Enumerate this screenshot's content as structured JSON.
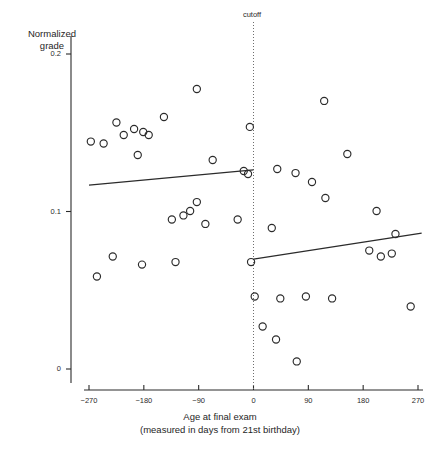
{
  "chart_data": {
    "type": "scatter",
    "title": "",
    "xlabel": "Age at final exam",
    "xlabel_line2": "(measured in days from 21st birthday)",
    "ylabel": "Normalized grade",
    "ylabel_line1": "Normalized",
    "ylabel_line2": "grade",
    "xlim": [
      -300,
      285
    ],
    "ylim": [
      -0.012,
      0.207
    ],
    "xticks": [
      -270,
      -180,
      -90,
      0,
      90,
      180,
      270
    ],
    "xticklabels": [
      "−270",
      "−180",
      "−90",
      "0",
      "90",
      "180",
      "270"
    ],
    "yticks": [
      0,
      0.1,
      0.2
    ],
    "yticklabels": [
      "0",
      "0.1",
      "0.2"
    ],
    "grid": false,
    "legend": false,
    "marker": "open-circle",
    "marker_color": "#2b2b2b",
    "line_color": "#2b2b2b",
    "annotations": [
      {
        "name": "cutoff",
        "label": "cutoff",
        "x": 0,
        "style": "dotted-vertical-line"
      }
    ],
    "series": [
      {
        "name": "left-of-cutoff points",
        "points": [
          [
            -267,
            0.1444
          ],
          [
            -246,
            0.1432
          ],
          [
            -225,
            0.1565
          ],
          [
            -213,
            0.1486
          ],
          [
            -196,
            0.1524
          ],
          [
            -190,
            0.1359
          ],
          [
            -181,
            0.1505
          ],
          [
            -172,
            0.1486
          ],
          [
            -147,
            0.16
          ],
          [
            -93,
            0.1778
          ],
          [
            -67,
            0.1327
          ],
          [
            -16,
            0.1257
          ],
          [
            -9,
            0.1238
          ],
          [
            -134,
            0.0949
          ],
          [
            -115,
            0.0975
          ],
          [
            -104,
            0.1003
          ],
          [
            -93,
            0.106
          ],
          [
            -79,
            0.0921
          ],
          [
            -257,
            0.0587
          ],
          [
            -231,
            0.0714
          ],
          [
            -183,
            0.0663
          ],
          [
            -128,
            0.0679
          ],
          [
            -6,
            0.1537
          ]
        ]
      },
      {
        "name": "right-of-cutoff points",
        "points": [
          [
            39,
            0.127
          ],
          [
            69,
            0.1244
          ],
          [
            116,
            0.1702
          ],
          [
            96,
            0.1187
          ],
          [
            154,
            0.1365
          ],
          [
            118,
            0.1086
          ],
          [
            202,
            0.1003
          ],
          [
            233,
            0.0857
          ],
          [
            190,
            0.0752
          ],
          [
            209,
            0.0714
          ],
          [
            227,
            0.0733
          ],
          [
            30,
            0.0895
          ],
          [
            2,
            0.046
          ],
          [
            44,
            0.0448
          ],
          [
            86,
            0.046
          ],
          [
            129,
            0.0448
          ],
          [
            258,
            0.0397
          ],
          [
            15,
            0.027
          ],
          [
            37,
            0.0187
          ],
          [
            71,
            0.0048
          ],
          [
            -26,
            0.0949
          ],
          [
            -4,
            0.0679
          ]
        ]
      }
    ],
    "fit_lines": [
      {
        "name": "left-regression-line",
        "side": "left",
        "x_start": -270,
        "y_start": 0.1168,
        "x_end": 0,
        "y_end": 0.1264
      },
      {
        "name": "right-regression-line",
        "side": "right",
        "x_start": 0,
        "y_start": 0.0698,
        "x_end": 276,
        "y_end": 0.0863
      }
    ]
  },
  "caption": ""
}
